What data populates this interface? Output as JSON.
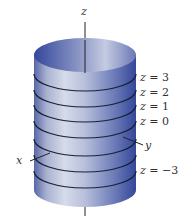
{
  "figure": {
    "type": "cylinder-with-level-curves",
    "axes": {
      "z_label": "z",
      "x_label": "x",
      "y_label": "y"
    },
    "level_labels": [
      {
        "text": "z = 3",
        "top": 72
      },
      {
        "text": "z = 2",
        "top": 87
      },
      {
        "text": "z = 1",
        "top": 101
      },
      {
        "text": "z = 0",
        "top": 116
      },
      {
        "text": "z = −3",
        "top": 165
      }
    ],
    "colors": {
      "cylinder_dark": "#3b4f9a",
      "cylinder_light": "#d6dcea",
      "ring": "#1a1f35",
      "axis": "#222222"
    }
  }
}
